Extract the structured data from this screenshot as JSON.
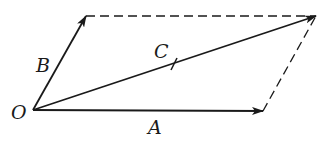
{
  "diagram": {
    "colors": {
      "stroke": "#1a1a1a",
      "background": "#ffffff"
    },
    "points": {
      "O": [
        33,
        110
      ],
      "A": [
        263,
        111
      ],
      "B": [
        86,
        16
      ],
      "C": [
        316,
        16
      ]
    },
    "vectors": [
      {
        "name": "A",
        "from": "O",
        "to": "A",
        "style": "solid"
      },
      {
        "name": "B",
        "from": "O",
        "to": "B",
        "style": "solid"
      },
      {
        "name": "C",
        "from": "O",
        "to": "C",
        "style": "solid",
        "tick_mark": true
      }
    ],
    "dashed_edges": [
      {
        "from": "B",
        "to": "C"
      },
      {
        "from": "A",
        "to": "C"
      }
    ],
    "labels": {
      "O": "O",
      "A": "A",
      "B": "B",
      "C": "C"
    }
  }
}
